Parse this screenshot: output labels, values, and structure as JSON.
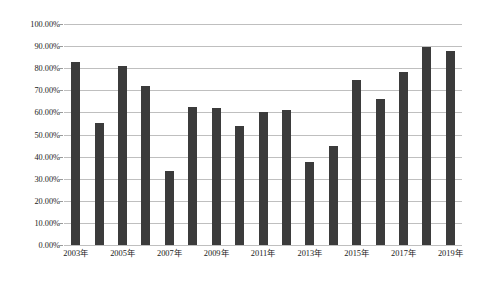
{
  "chart_data": {
    "type": "bar",
    "title": "",
    "subtitle": "",
    "xlabel": "",
    "ylabel": "",
    "ylim": [
      0,
      1.0
    ],
    "grid": true,
    "legend": "none",
    "bar_color": "#3b3b3b",
    "gridline_color": "#bfbfbf",
    "value_format": "percent_2dp",
    "categories": [
      "2003年",
      "2004年",
      "2005年",
      "2006年",
      "2007年",
      "2008年",
      "2009年",
      "2010年",
      "2011年",
      "2012年",
      "2013年",
      "2014年",
      "2015年",
      "2016年",
      "2017年",
      "2018年",
      "2019年"
    ],
    "visible_tick_labels": [
      "2003年",
      "2005年",
      "2007年",
      "2009年",
      "2011年",
      "2013年",
      "2015年",
      "2017年",
      "2019年"
    ],
    "values": [
      0.83,
      0.55,
      0.81,
      0.72,
      0.335,
      0.625,
      0.62,
      0.54,
      0.6,
      0.61,
      0.375,
      0.45,
      0.745,
      0.66,
      0.785,
      0.895,
      0.88
    ],
    "yticks": [
      0,
      0.1,
      0.2,
      0.3,
      0.4,
      0.5,
      0.6,
      0.7,
      0.8,
      0.9,
      1.0
    ],
    "ytick_labels": [
      "0.00%",
      "10.00%",
      "20.00%",
      "30.00%",
      "40.00%",
      "50.00%",
      "60.00%",
      "70.00%",
      "80.00%",
      "90.00%",
      "100.00%"
    ]
  }
}
